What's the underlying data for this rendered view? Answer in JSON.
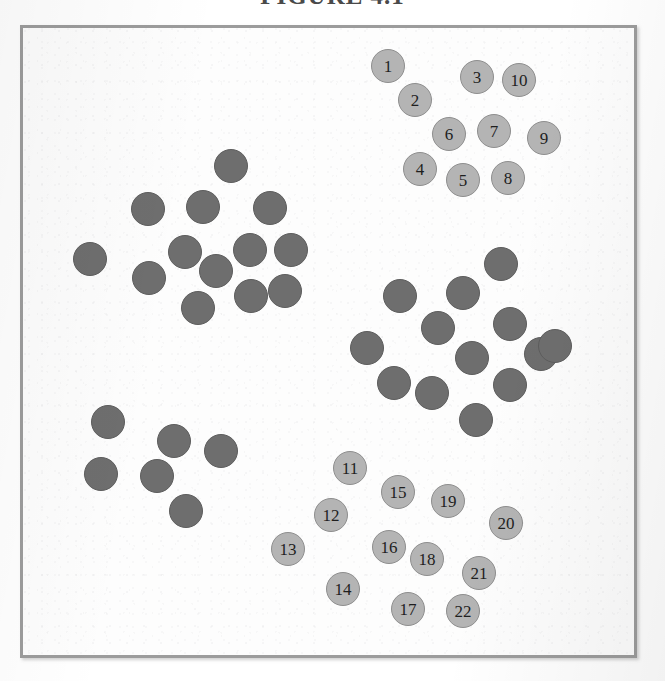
{
  "figure": {
    "title": "FIGURE 4.1",
    "title_visible_fragment": "FIGURE 4.1",
    "frame": {
      "border_color": "#9c9c9c",
      "background_color": "#fdfdfd"
    }
  },
  "legend": {
    "dark_color": "#6e6e6e",
    "light_color": "#b4b4b4"
  },
  "chart_data": {
    "type": "scatter",
    "title": "FIGURE 4.1",
    "xlabel": "",
    "ylabel": "",
    "xlim": [
      0,
      617
    ],
    "ylim": [
      0,
      633
    ],
    "grid": false,
    "legend_position": "none",
    "series": [
      {
        "name": "Cluster A (upper-left, unlabeled)",
        "color": "#6e6e6e",
        "style": "dark",
        "count": 13,
        "points": [
          {
            "label": "",
            "x": 208,
            "y": 138
          },
          {
            "label": "",
            "x": 125,
            "y": 181
          },
          {
            "label": "",
            "x": 180,
            "y": 179
          },
          {
            "label": "",
            "x": 247,
            "y": 180
          },
          {
            "label": "",
            "x": 67,
            "y": 231
          },
          {
            "label": "",
            "x": 162,
            "y": 224
          },
          {
            "label": "",
            "x": 227,
            "y": 222
          },
          {
            "label": "",
            "x": 268,
            "y": 222
          },
          {
            "label": "",
            "x": 126,
            "y": 250
          },
          {
            "label": "",
            "x": 193,
            "y": 243
          },
          {
            "label": "",
            "x": 175,
            "y": 280
          },
          {
            "label": "",
            "x": 228,
            "y": 268
          },
          {
            "label": "",
            "x": 262,
            "y": 263
          }
        ]
      },
      {
        "name": "Cluster B (upper-right, numbered 1-10)",
        "color": "#b4b4b4",
        "style": "light",
        "count": 10,
        "points": [
          {
            "label": "1",
            "x": 365,
            "y": 38
          },
          {
            "label": "2",
            "x": 392,
            "y": 72
          },
          {
            "label": "3",
            "x": 454,
            "y": 49
          },
          {
            "label": "10",
            "x": 496,
            "y": 52
          },
          {
            "label": "6",
            "x": 426,
            "y": 106
          },
          {
            "label": "7",
            "x": 471,
            "y": 103
          },
          {
            "label": "9",
            "x": 521,
            "y": 110
          },
          {
            "label": "4",
            "x": 397,
            "y": 141
          },
          {
            "label": "5",
            "x": 440,
            "y": 152
          },
          {
            "label": "8",
            "x": 485,
            "y": 150
          }
        ]
      },
      {
        "name": "Cluster C (mid-right, unlabeled)",
        "color": "#6e6e6e",
        "style": "dark",
        "count": 13,
        "points": [
          {
            "label": "",
            "x": 478,
            "y": 236
          },
          {
            "label": "",
            "x": 377,
            "y": 268
          },
          {
            "label": "",
            "x": 440,
            "y": 265
          },
          {
            "label": "",
            "x": 487,
            "y": 296
          },
          {
            "label": "",
            "x": 415,
            "y": 300
          },
          {
            "label": "",
            "x": 344,
            "y": 320
          },
          {
            "label": "",
            "x": 449,
            "y": 330
          },
          {
            "label": "",
            "x": 518,
            "y": 326
          },
          {
            "label": "",
            "x": 371,
            "y": 355
          },
          {
            "label": "",
            "x": 409,
            "y": 365
          },
          {
            "label": "",
            "x": 487,
            "y": 357
          },
          {
            "label": "",
            "x": 453,
            "y": 392
          },
          {
            "label": "",
            "x": 532,
            "y": 318
          }
        ]
      },
      {
        "name": "Cluster D (lower-left, unlabeled)",
        "color": "#6e6e6e",
        "style": "dark",
        "count": 6,
        "points": [
          {
            "label": "",
            "x": 85,
            "y": 394
          },
          {
            "label": "",
            "x": 151,
            "y": 413
          },
          {
            "label": "",
            "x": 198,
            "y": 423
          },
          {
            "label": "",
            "x": 78,
            "y": 446
          },
          {
            "label": "",
            "x": 134,
            "y": 448
          },
          {
            "label": "",
            "x": 163,
            "y": 483
          }
        ]
      },
      {
        "name": "Cluster E (lower-centre, numbered 11-22)",
        "color": "#b4b4b4",
        "style": "light",
        "count": 12,
        "points": [
          {
            "label": "11",
            "x": 327,
            "y": 440
          },
          {
            "label": "15",
            "x": 375,
            "y": 464
          },
          {
            "label": "19",
            "x": 425,
            "y": 473
          },
          {
            "label": "12",
            "x": 308,
            "y": 487
          },
          {
            "label": "20",
            "x": 483,
            "y": 495
          },
          {
            "label": "13",
            "x": 265,
            "y": 521
          },
          {
            "label": "16",
            "x": 366,
            "y": 519
          },
          {
            "label": "18",
            "x": 404,
            "y": 531
          },
          {
            "label": "21",
            "x": 456,
            "y": 545
          },
          {
            "label": "14",
            "x": 320,
            "y": 561
          },
          {
            "label": "17",
            "x": 385,
            "y": 581
          },
          {
            "label": "22",
            "x": 440,
            "y": 583
          }
        ]
      }
    ]
  }
}
